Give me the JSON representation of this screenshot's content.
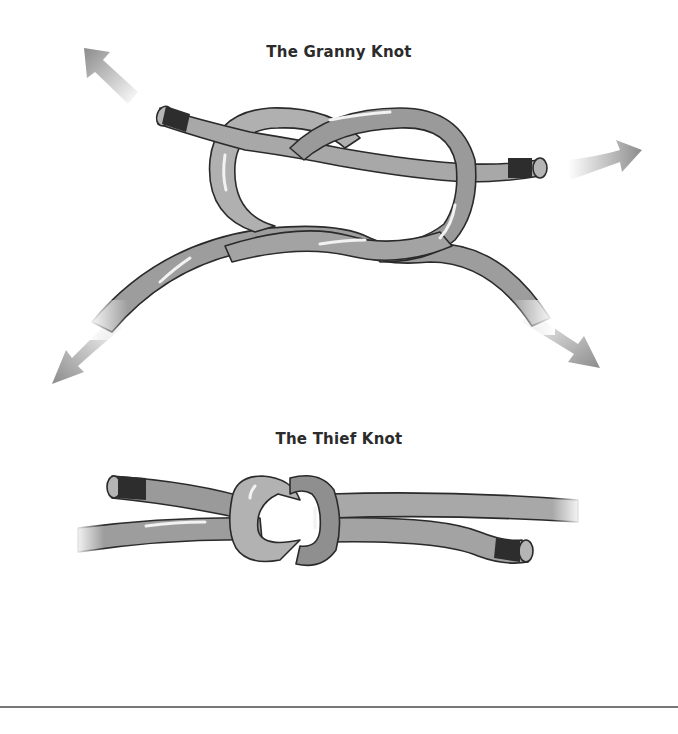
{
  "diagrams": [
    {
      "title": "The Granny Knot",
      "arrows": [
        "arrow-up-left",
        "arrow-right",
        "arrow-down-left",
        "arrow-down-right"
      ]
    },
    {
      "title": "The Thief Knot"
    }
  ],
  "colors": {
    "rope_fill": "#a3a3a3",
    "rope_fill_dark": "#8a8a8a",
    "rope_outline": "#2a2a2a",
    "whipping": "#2d2d2d",
    "arrow": "#9b9b9b",
    "title_text": "#2b2b2b",
    "rule": "#777777"
  }
}
